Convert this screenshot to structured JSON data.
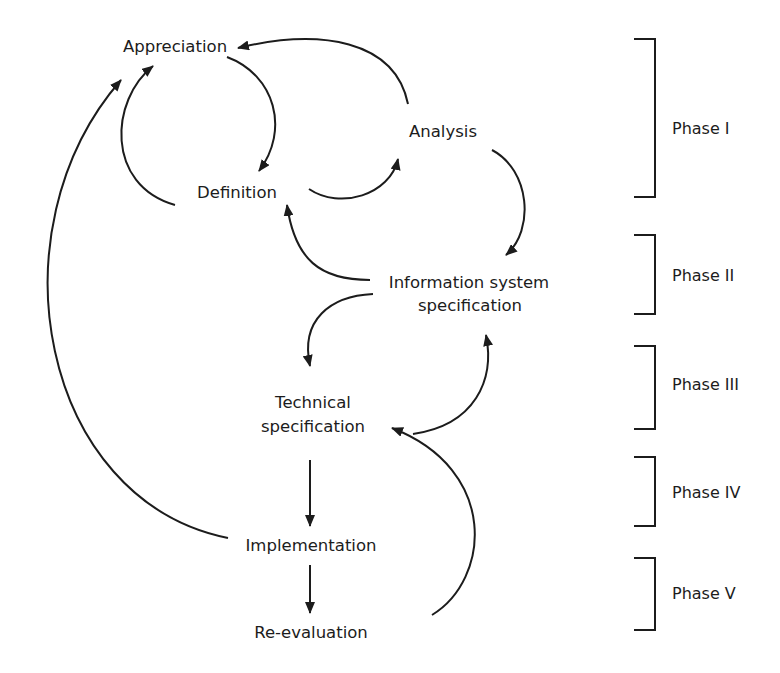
{
  "diagram": {
    "type": "process-cycle",
    "nodes": {
      "appreciation": {
        "label": "Appreciation"
      },
      "analysis": {
        "label": "Analysis"
      },
      "definition": {
        "label": "Definition"
      },
      "info_spec": {
        "line1": "Information system",
        "line2": "specification"
      },
      "tech_spec": {
        "line1": "Technical",
        "line2": "specification"
      },
      "implementation": {
        "label": "Implementation"
      },
      "reevaluation": {
        "label": "Re-evaluation"
      }
    },
    "edges": [
      {
        "from": "Analysis",
        "to": "Appreciation"
      },
      {
        "from": "Appreciation",
        "to": "Definition"
      },
      {
        "from": "Definition",
        "to": "Appreciation"
      },
      {
        "from": "Definition",
        "to": "Analysis"
      },
      {
        "from": "Analysis",
        "to": "Information system specification"
      },
      {
        "from": "Information system specification",
        "to": "Definition"
      },
      {
        "from": "Information system specification",
        "to": "Technical specification"
      },
      {
        "from": "Technical specification",
        "to": "Information system specification"
      },
      {
        "from": "Technical specification",
        "to": "Implementation"
      },
      {
        "from": "Implementation",
        "to": "Re-evaluation"
      },
      {
        "from": "Implementation",
        "to": "Appreciation"
      },
      {
        "from": "Re-evaluation",
        "to": "Technical specification"
      }
    ],
    "phases": [
      {
        "label": "Phase I"
      },
      {
        "label": "Phase II"
      },
      {
        "label": "Phase III"
      },
      {
        "label": "Phase IV"
      },
      {
        "label": "Phase V"
      }
    ],
    "colors": {
      "ink": "#1c1c1c",
      "background": "#ffffff"
    }
  }
}
